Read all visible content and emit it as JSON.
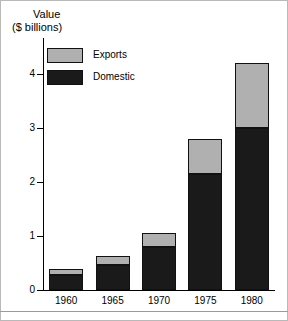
{
  "chart_data": {
    "type": "bar",
    "subtype": "stacked-vertical",
    "title": "",
    "ylabel_line1": "Value",
    "ylabel_line2": "($ billions)",
    "xlabel": "",
    "categories": [
      "1960",
      "1965",
      "1970",
      "1975",
      "1980"
    ],
    "series": [
      {
        "name": "Domestic",
        "color": "#1a1a1a",
        "values": [
          0.27,
          0.46,
          0.8,
          2.15,
          3.0
        ]
      },
      {
        "name": "Exports",
        "color": "#b0b0b0",
        "values": [
          0.11,
          0.17,
          0.26,
          0.65,
          1.2
        ]
      }
    ],
    "totals": [
      0.38,
      0.63,
      1.06,
      2.8,
      4.2
    ],
    "yticks": [
      0,
      1,
      2,
      3,
      4
    ],
    "ytick_labels": [
      "0",
      "1",
      "2",
      "3",
      "4"
    ],
    "ylim": [
      0,
      4.67
    ],
    "grid": false,
    "legend_position": "upper-left",
    "legend_entries": [
      "Exports",
      "Domestic"
    ]
  },
  "figure": {
    "background": "#ffffff",
    "axis_color": "#000000",
    "frame_color": "#b9b9b9"
  }
}
